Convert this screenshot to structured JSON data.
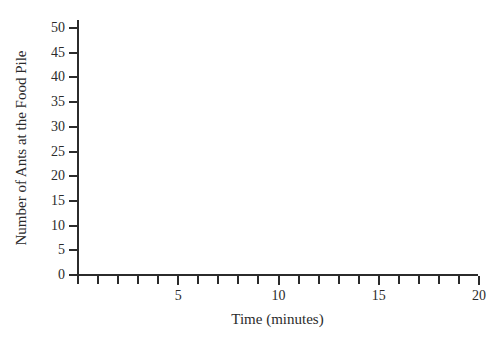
{
  "figure": {
    "background_color": "#ffffff",
    "ink_color": "#2b2b2b",
    "plot_area_note": "empty"
  },
  "chart_data": {
    "type": "line",
    "title": "",
    "subtitle": "",
    "xlabel": "Time (minutes)",
    "ylabel": "Number of Ants at the Food Pile",
    "xlim": [
      0,
      20
    ],
    "ylim": [
      0,
      50
    ],
    "x_major_ticks": [
      5,
      10,
      15,
      20
    ],
    "x_major_tick_labels": [
      "5",
      "10",
      "15",
      "20"
    ],
    "x_minor_ticks": [
      0,
      1,
      2,
      3,
      4,
      6,
      7,
      8,
      9,
      11,
      12,
      13,
      14,
      16,
      17,
      18,
      19
    ],
    "x_tick_interval": 1,
    "y_ticks": [
      0,
      5,
      10,
      15,
      20,
      25,
      30,
      35,
      40,
      45,
      50
    ],
    "y_tick_labels": [
      "0",
      "5",
      "10",
      "15",
      "20",
      "25",
      "30",
      "35",
      "40",
      "45",
      "50"
    ],
    "y_tick_interval": 5,
    "grid": false,
    "legend": null,
    "legend_position": "none",
    "series": [],
    "x": [],
    "values": [],
    "annotations": [],
    "data_points_present": false
  },
  "axes": {
    "y": {
      "title": "Number of Ants at the Food Pile",
      "labels": [
        "50",
        "45",
        "40",
        "35",
        "30",
        "25",
        "20",
        "15",
        "10",
        "5",
        "0"
      ]
    },
    "x": {
      "title": "Time (minutes)",
      "labels": [
        "5",
        "10",
        "15",
        "20"
      ]
    }
  }
}
